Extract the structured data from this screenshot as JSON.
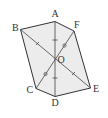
{
  "diagram": {
    "colors": {
      "fill": "#ececec",
      "stroke": "#333333",
      "label": "#333333"
    },
    "points": {
      "A": {
        "x": 55,
        "y": 21.5,
        "label": "A"
      },
      "B": {
        "x": 20.5,
        "y": 29.5,
        "label": "B"
      },
      "C": {
        "x": 36,
        "y": 88.5,
        "label": "C"
      },
      "D": {
        "x": 55,
        "y": 96.5,
        "label": "D"
      },
      "E": {
        "x": 90.5,
        "y": 88,
        "label": "E"
      },
      "F": {
        "x": 74,
        "y": 31,
        "label": "F"
      },
      "O": {
        "x": 55,
        "y": 59.5,
        "label": "O"
      }
    },
    "segments": [
      {
        "from": "A",
        "to": "D",
        "marks": "single-tick"
      },
      {
        "from": "B",
        "to": "E",
        "marks": "cross-tick"
      },
      {
        "from": "F",
        "to": "C",
        "marks": "circle"
      }
    ],
    "labels": {
      "A": "A",
      "B": "B",
      "C": "C",
      "D": "D",
      "E": "E",
      "F": "F",
      "O": "O"
    }
  }
}
